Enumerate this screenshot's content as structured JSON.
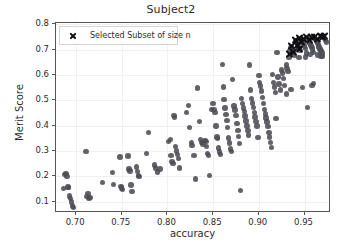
{
  "chart_data": {
    "type": "scatter",
    "title": "Subject2",
    "xlabel": "accuracy",
    "ylabel": "Merit Score",
    "xlim": [
      0.678,
      0.979
    ],
    "ylim": [
      0.055,
      0.805
    ],
    "xticks": [
      "0.70",
      "0.75",
      "0.80",
      "0.85",
      "0.90",
      "0.95"
    ],
    "xtick_values": [
      0.7,
      0.75,
      0.8,
      0.85,
      0.9,
      0.95
    ],
    "yticks": [
      "0.1",
      "0.2",
      "0.3",
      "0.4",
      "0.5",
      "0.6",
      "0.7",
      "0.8"
    ],
    "ytick_values": [
      0.1,
      0.2,
      0.3,
      0.4,
      0.5,
      0.6,
      0.7,
      0.8
    ],
    "grid": true,
    "legend_position": "upper left",
    "series": [
      {
        "name": "all points",
        "marker": "circle",
        "color": "#4c4c54",
        "points": [
          [
            0.686,
            0.151
          ],
          [
            0.688,
            0.206
          ],
          [
            0.689,
            0.212
          ],
          [
            0.69,
            0.2
          ],
          [
            0.691,
            0.157
          ],
          [
            0.692,
            0.155
          ],
          [
            0.693,
            0.122
          ],
          [
            0.694,
            0.112
          ],
          [
            0.695,
            0.098
          ],
          [
            0.696,
            0.082
          ],
          [
            0.697,
            0.077
          ],
          [
            0.711,
            0.297
          ],
          [
            0.712,
            0.12
          ],
          [
            0.713,
            0.131
          ],
          [
            0.714,
            0.112
          ],
          [
            0.715,
            0.117
          ],
          [
            0.729,
            0.176
          ],
          [
            0.74,
            0.215
          ],
          [
            0.741,
            0.168
          ],
          [
            0.748,
            0.276
          ],
          [
            0.749,
            0.16
          ],
          [
            0.75,
            0.154
          ],
          [
            0.751,
            0.148
          ],
          [
            0.757,
            0.28
          ],
          [
            0.758,
            0.228
          ],
          [
            0.759,
            0.221
          ],
          [
            0.76,
            0.165
          ],
          [
            0.761,
            0.141
          ],
          [
            0.766,
            0.237
          ],
          [
            0.767,
            0.219
          ],
          [
            0.768,
            0.204
          ],
          [
            0.769,
            0.198
          ],
          [
            0.777,
            0.291
          ],
          [
            0.779,
            0.374
          ],
          [
            0.786,
            0.245
          ],
          [
            0.787,
            0.232
          ],
          [
            0.789,
            0.217
          ],
          [
            0.792,
            0.229
          ],
          [
            0.801,
            0.338
          ],
          [
            0.803,
            0.346
          ],
          [
            0.804,
            0.281
          ],
          [
            0.805,
            0.258
          ],
          [
            0.806,
            0.251
          ],
          [
            0.807,
            0.441
          ],
          [
            0.808,
            0.432
          ],
          [
            0.809,
            0.318
          ],
          [
            0.81,
            0.3
          ],
          [
            0.811,
            0.285
          ],
          [
            0.812,
            0.269
          ],
          [
            0.813,
            0.232
          ],
          [
            0.821,
            0.451
          ],
          [
            0.823,
            0.479
          ],
          [
            0.824,
            0.393
          ],
          [
            0.826,
            0.333
          ],
          [
            0.827,
            0.322
          ],
          [
            0.829,
            0.283
          ],
          [
            0.831,
            0.189
          ],
          [
            0.833,
            0.549
          ],
          [
            0.835,
            0.417
          ],
          [
            0.836,
            0.345
          ],
          [
            0.838,
            0.334
          ],
          [
            0.839,
            0.328
          ],
          [
            0.841,
            0.342
          ],
          [
            0.842,
            0.338
          ],
          [
            0.843,
            0.318
          ],
          [
            0.844,
            0.291
          ],
          [
            0.845,
            0.283
          ],
          [
            0.846,
            0.203
          ],
          [
            0.848,
            0.463
          ],
          [
            0.85,
            0.488
          ],
          [
            0.851,
            0.464
          ],
          [
            0.852,
            0.452
          ],
          [
            0.853,
            0.398
          ],
          [
            0.854,
            0.355
          ],
          [
            0.855,
            0.348
          ],
          [
            0.856,
            0.312
          ],
          [
            0.857,
            0.296
          ],
          [
            0.858,
            0.286
          ],
          [
            0.86,
            0.641
          ],
          [
            0.861,
            0.553
          ],
          [
            0.862,
            0.502
          ],
          [
            0.863,
            0.47
          ],
          [
            0.864,
            0.443
          ],
          [
            0.865,
            0.419
          ],
          [
            0.866,
            0.392
          ],
          [
            0.867,
            0.351
          ],
          [
            0.868,
            0.332
          ],
          [
            0.869,
            0.308
          ],
          [
            0.87,
            0.297
          ],
          [
            0.871,
            0.583
          ],
          [
            0.873,
            0.478
          ],
          [
            0.874,
            0.461
          ],
          [
            0.875,
            0.439
          ],
          [
            0.876,
            0.408
          ],
          [
            0.877,
            0.38
          ],
          [
            0.878,
            0.356
          ],
          [
            0.879,
            0.33
          ],
          [
            0.88,
            0.143
          ],
          [
            0.881,
            0.508
          ],
          [
            0.882,
            0.487
          ],
          [
            0.883,
            0.47
          ],
          [
            0.884,
            0.456
          ],
          [
            0.885,
            0.438
          ],
          [
            0.886,
            0.418
          ],
          [
            0.887,
            0.399
          ],
          [
            0.888,
            0.381
          ],
          [
            0.889,
            0.363
          ],
          [
            0.89,
            0.64
          ],
          [
            0.891,
            0.541
          ],
          [
            0.892,
            0.507
          ],
          [
            0.893,
            0.489
          ],
          [
            0.894,
            0.471
          ],
          [
            0.895,
            0.452
          ],
          [
            0.896,
            0.434
          ],
          [
            0.897,
            0.416
          ],
          [
            0.898,
            0.398
          ],
          [
            0.899,
            0.352
          ],
          [
            0.9,
            0.598
          ],
          [
            0.901,
            0.569
          ],
          [
            0.902,
            0.556
          ],
          [
            0.903,
            0.537
          ],
          [
            0.904,
            0.512
          ],
          [
            0.905,
            0.487
          ],
          [
            0.906,
            0.463
          ],
          [
            0.907,
            0.446
          ],
          [
            0.908,
            0.43
          ],
          [
            0.909,
            0.414
          ],
          [
            0.91,
            0.397
          ],
          [
            0.911,
            0.373
          ],
          [
            0.912,
            0.355
          ],
          [
            0.913,
            0.334
          ],
          [
            0.914,
            0.313
          ],
          [
            0.915,
            0.601
          ],
          [
            0.916,
            0.571
          ],
          [
            0.917,
            0.553
          ],
          [
            0.918,
            0.53
          ],
          [
            0.919,
            0.429
          ],
          [
            0.92,
            0.688
          ],
          [
            0.921,
            0.592
          ],
          [
            0.922,
            0.564
          ],
          [
            0.924,
            0.541
          ],
          [
            0.925,
            0.62
          ],
          [
            0.926,
            0.607
          ],
          [
            0.927,
            0.586
          ],
          [
            0.928,
            0.559
          ],
          [
            0.93,
            0.64
          ],
          [
            0.931,
            0.625
          ],
          [
            0.932,
            0.614
          ],
          [
            0.933,
            0.668
          ],
          [
            0.934,
            0.697
          ],
          [
            0.935,
            0.706
          ],
          [
            0.936,
            0.713
          ],
          [
            0.937,
            0.7
          ],
          [
            0.938,
            0.688
          ],
          [
            0.939,
            0.676
          ],
          [
            0.94,
            0.735
          ],
          [
            0.941,
            0.727
          ],
          [
            0.942,
            0.719
          ],
          [
            0.943,
            0.712
          ],
          [
            0.944,
            0.704
          ],
          [
            0.945,
            0.697
          ],
          [
            0.946,
            0.743
          ],
          [
            0.947,
            0.736
          ],
          [
            0.948,
            0.729
          ],
          [
            0.949,
            0.722
          ],
          [
            0.95,
            0.714
          ],
          [
            0.951,
            0.705
          ],
          [
            0.952,
            0.687
          ],
          [
            0.953,
            0.472
          ],
          [
            0.954,
            0.742
          ],
          [
            0.955,
            0.733
          ],
          [
            0.956,
            0.725
          ],
          [
            0.957,
            0.717
          ],
          [
            0.958,
            0.709
          ],
          [
            0.959,
            0.699
          ],
          [
            0.96,
            0.566
          ],
          [
            0.961,
            0.749
          ],
          [
            0.962,
            0.741
          ],
          [
            0.963,
            0.733
          ],
          [
            0.964,
            0.726
          ],
          [
            0.965,
            0.718
          ],
          [
            0.966,
            0.71
          ],
          [
            0.967,
            0.702
          ],
          [
            0.968,
            0.694
          ],
          [
            0.969,
            0.686
          ],
          [
            0.97,
            0.675
          ],
          [
            0.971,
            0.752
          ],
          [
            0.972,
            0.744
          ],
          [
            0.973,
            0.737
          ],
          [
            0.974,
            0.73
          ],
          [
            0.958,
            0.559
          ],
          [
            0.948,
            0.551
          ],
          [
            0.93,
            0.525
          ],
          [
            0.935,
            0.542
          ],
          [
            0.944,
            0.669
          ],
          [
            0.951,
            0.671
          ],
          [
            0.956,
            0.681
          ],
          [
            0.96,
            0.689
          ],
          [
            0.964,
            0.678
          ],
          [
            0.968,
            0.672
          ]
        ]
      },
      {
        "name": "Selected Subset of size n",
        "marker": "x",
        "color": "#101014",
        "points": [
          [
            0.936,
            0.715
          ],
          [
            0.94,
            0.738
          ],
          [
            0.942,
            0.722
          ],
          [
            0.945,
            0.748
          ],
          [
            0.947,
            0.731
          ],
          [
            0.949,
            0.742
          ],
          [
            0.952,
            0.752
          ],
          [
            0.955,
            0.739
          ],
          [
            0.958,
            0.75
          ],
          [
            0.961,
            0.753
          ],
          [
            0.964,
            0.744
          ],
          [
            0.967,
            0.755
          ],
          [
            0.97,
            0.751
          ],
          [
            0.972,
            0.757
          ],
          [
            0.938,
            0.693
          ],
          [
            0.944,
            0.706
          ],
          [
            0.934,
            0.684
          ]
        ]
      }
    ]
  },
  "legend": {
    "entries": [
      {
        "label": "Selected Subset of size n",
        "marker": "x-marker"
      }
    ]
  }
}
